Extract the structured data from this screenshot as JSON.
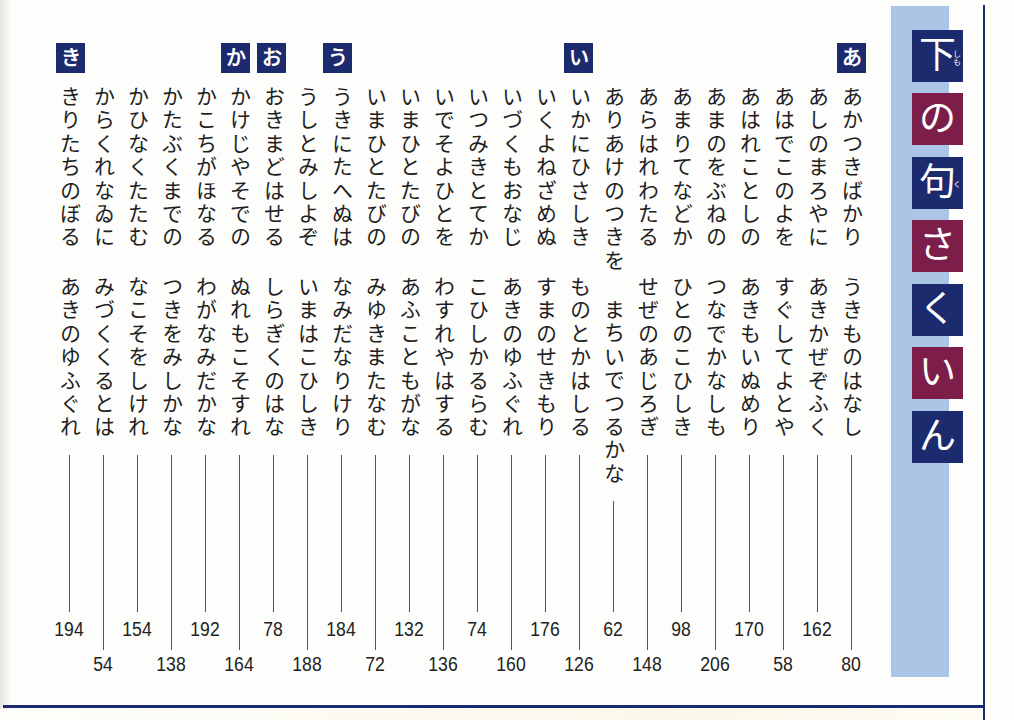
{
  "title": {
    "text": "下の句さくいん",
    "chars": [
      {
        "char": "下",
        "ruby": "しも"
      },
      {
        "char": "の"
      },
      {
        "char": "句",
        "ruby": "く"
      },
      {
        "char": "さ"
      },
      {
        "char": "く"
      },
      {
        "char": "い"
      },
      {
        "char": "ん"
      }
    ]
  },
  "section_tags": {
    "a": "あ",
    "i": "い",
    "u": "う",
    "o": "お",
    "ka": "か",
    "ki": "き"
  },
  "entries": [
    {
      "line1": "あかつきばかり",
      "line2": "うきものはなし",
      "page": "80"
    },
    {
      "line1": "あしのまろやに",
      "line2": "あきかぜぞふく",
      "page": "162"
    },
    {
      "line1": "あはでこのよを",
      "line2": "すぐしてよとや",
      "page": "58"
    },
    {
      "line1": "あはれことしの",
      "line2": "あきもいぬめり",
      "page": "170"
    },
    {
      "line1": "あまのをぶねの",
      "line2": "つなでかなしも",
      "page": "206"
    },
    {
      "line1": "あまりてなどか",
      "line2": "ひとのこひしき",
      "page": "98"
    },
    {
      "line1": "あらはれわたる",
      "line2": "せぜのあじろぎ",
      "page": "148"
    },
    {
      "line1": "ありあけのつきを",
      "line2": "まちいでつるかな",
      "page": "62"
    },
    {
      "line1": "いかにひさしき",
      "line2": "ものとかはしる",
      "page": "126"
    },
    {
      "line1": "いくよねざめぬ",
      "line2": "すまのせきもり",
      "page": "176"
    },
    {
      "line1": "いづくもおなじ",
      "line2": "あきのゆふぐれ",
      "page": "160"
    },
    {
      "line1": "いつみきとてか",
      "line2": "こひしかるらむ",
      "page": "74"
    },
    {
      "line1": "いでそよひとを",
      "line2": "わすれやはする",
      "page": "136"
    },
    {
      "line1": "いまひとたびの",
      "line2": "あふこともがな",
      "page": "132"
    },
    {
      "line1": "いまひとたびの",
      "line2": "みゆきまたなむ",
      "page": "72"
    },
    {
      "line1": "うきにたへぬは",
      "line2": "なみだなりけり",
      "page": "184"
    },
    {
      "line1": "うしとみしよぞ",
      "line2": "いまはこひしき",
      "page": "188"
    },
    {
      "line1": "おきまどはせる",
      "line2": "しらぎくのはな",
      "page": "78"
    },
    {
      "line1": "かけじやそでの",
      "line2": "ぬれもこそすれ",
      "page": "164"
    },
    {
      "line1": "かこちがほなる",
      "line2": "わがなみだかな",
      "page": "192"
    },
    {
      "line1": "かたぶくまでの",
      "line2": "つきをみしかな",
      "page": "138"
    },
    {
      "line1": "かひなくたたむ",
      "line2": "なこそをしけれ",
      "page": "154"
    },
    {
      "line1": "からくれなゐに",
      "line2": "みづくくるとは",
      "page": "54"
    },
    {
      "line1": "きりたちのぼる",
      "line2": "あきのゆふぐれ",
      "page": "194"
    }
  ],
  "colors": {
    "navy": "#1c2a6e",
    "maroon": "#7d1d4a",
    "title_band": "#aac5e6",
    "text": "#1f1f1f"
  }
}
